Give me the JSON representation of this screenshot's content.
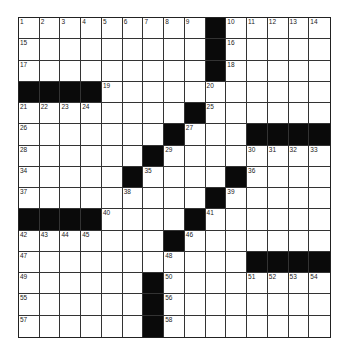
{
  "puzzle": {
    "rows": 15,
    "cols": 15,
    "layout": [
      "#########B#####",
      "#########B#####",
      "#########B#####",
      "BBBB###########",
      "########B######",
      "#######B###BBBB",
      "######B########",
      "#####B####B####",
      "#########B#####",
      "BBBB####B######",
      "#######B#######",
      "###########BBBB",
      "######B########",
      "######B########",
      "######B########"
    ],
    "numbers": [
      {
        "r": 0,
        "c": 0,
        "n": "1"
      },
      {
        "r": 0,
        "c": 1,
        "n": "2"
      },
      {
        "r": 0,
        "c": 2,
        "n": "3"
      },
      {
        "r": 0,
        "c": 3,
        "n": "4"
      },
      {
        "r": 0,
        "c": 4,
        "n": "5"
      },
      {
        "r": 0,
        "c": 5,
        "n": "6"
      },
      {
        "r": 0,
        "c": 6,
        "n": "7"
      },
      {
        "r": 0,
        "c": 7,
        "n": "8"
      },
      {
        "r": 0,
        "c": 8,
        "n": "9"
      },
      {
        "r": 0,
        "c": 10,
        "n": "10"
      },
      {
        "r": 0,
        "c": 11,
        "n": "11"
      },
      {
        "r": 0,
        "c": 12,
        "n": "12"
      },
      {
        "r": 0,
        "c": 13,
        "n": "13"
      },
      {
        "r": 0,
        "c": 14,
        "n": "14"
      },
      {
        "r": 1,
        "c": 0,
        "n": "15"
      },
      {
        "r": 1,
        "c": 10,
        "n": "16"
      },
      {
        "r": 2,
        "c": 0,
        "n": "17"
      },
      {
        "r": 2,
        "c": 10,
        "n": "18"
      },
      {
        "r": 3,
        "c": 4,
        "n": "19"
      },
      {
        "r": 3,
        "c": 9,
        "n": "20"
      },
      {
        "r": 4,
        "c": 0,
        "n": "21"
      },
      {
        "r": 4,
        "c": 1,
        "n": "22"
      },
      {
        "r": 4,
        "c": 2,
        "n": "23"
      },
      {
        "r": 4,
        "c": 3,
        "n": "24"
      },
      {
        "r": 4,
        "c": 9,
        "n": "25"
      },
      {
        "r": 5,
        "c": 0,
        "n": "26"
      },
      {
        "r": 5,
        "c": 8,
        "n": "27"
      },
      {
        "r": 6,
        "c": 0,
        "n": "28"
      },
      {
        "r": 6,
        "c": 7,
        "n": "29"
      },
      {
        "r": 6,
        "c": 11,
        "n": "30"
      },
      {
        "r": 6,
        "c": 12,
        "n": "31"
      },
      {
        "r": 6,
        "c": 13,
        "n": "32"
      },
      {
        "r": 6,
        "c": 14,
        "n": "33"
      },
      {
        "r": 7,
        "c": 0,
        "n": "34"
      },
      {
        "r": 7,
        "c": 6,
        "n": "35"
      },
      {
        "r": 7,
        "c": 11,
        "n": "36"
      },
      {
        "r": 8,
        "c": 0,
        "n": "37"
      },
      {
        "r": 8,
        "c": 5,
        "n": "38"
      },
      {
        "r": 8,
        "c": 10,
        "n": "39"
      },
      {
        "r": 9,
        "c": 4,
        "n": "40"
      },
      {
        "r": 9,
        "c": 9,
        "n": "41"
      },
      {
        "r": 10,
        "c": 0,
        "n": "42"
      },
      {
        "r": 10,
        "c": 1,
        "n": "43"
      },
      {
        "r": 10,
        "c": 2,
        "n": "44"
      },
      {
        "r": 10,
        "c": 3,
        "n": "45"
      },
      {
        "r": 10,
        "c": 8,
        "n": "46"
      },
      {
        "r": 11,
        "c": 0,
        "n": "47"
      },
      {
        "r": 11,
        "c": 7,
        "n": "48"
      },
      {
        "r": 12,
        "c": 0,
        "n": "49"
      },
      {
        "r": 12,
        "c": 7,
        "n": "50"
      },
      {
        "r": 12,
        "c": 11,
        "n": "51"
      },
      {
        "r": 12,
        "c": 12,
        "n": "52"
      },
      {
        "r": 12,
        "c": 13,
        "n": "53"
      },
      {
        "r": 12,
        "c": 14,
        "n": "54"
      },
      {
        "r": 13,
        "c": 0,
        "n": "55"
      },
      {
        "r": 13,
        "c": 7,
        "n": "56"
      },
      {
        "r": 14,
        "c": 0,
        "n": "57"
      },
      {
        "r": 14,
        "c": 7,
        "n": "58"
      }
    ]
  },
  "colors": {
    "black_square": "#0a0a0a",
    "grid_line": "#333333",
    "background": "#ffffff"
  }
}
